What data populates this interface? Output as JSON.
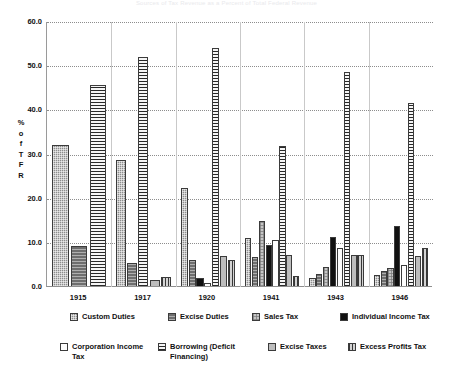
{
  "chart_data": {
    "type": "bar",
    "title": "Sources of Tax Revenue as a Percent of Total Federal Revenue",
    "xlabel": "",
    "ylabel": "% of TFR",
    "ylabel_chars": [
      "%",
      "o",
      "f",
      "T",
      "F",
      "R"
    ],
    "ylim": [
      0.0,
      60.0
    ],
    "yticks": [
      "0.0",
      "10.0",
      "20.0",
      "30.0",
      "40.0",
      "50.0",
      "60.0"
    ],
    "ytick_values": [
      0.0,
      10.0,
      20.0,
      30.0,
      40.0,
      50.0,
      60.0
    ],
    "grid": true,
    "legend_position": "bottom",
    "categories": [
      "1915",
      "1917",
      "1920",
      "1941",
      "1943",
      "1946"
    ],
    "series": [
      {
        "name": "Custom Duties",
        "key": "custom",
        "pattern": "p-custom",
        "color": "#8d8d8d",
        "values": [
          32.0,
          28.5,
          22.2,
          10.8,
          1.9,
          2.4
        ]
      },
      {
        "name": "Excise Duties",
        "key": "excised",
        "pattern": "p-excised",
        "color": "#6e6e6e",
        "values": [
          9.0,
          5.2,
          5.8,
          6.6,
          2.8,
          3.4
        ]
      },
      {
        "name": "Sales Tax",
        "key": "sales",
        "pattern": "p-sales",
        "color": "#c6c6c6",
        "values": [
          0.0,
          0.0,
          0.0,
          14.7,
          4.4,
          4.1
        ]
      },
      {
        "name": "Individual Income Tax",
        "key": "indinc",
        "pattern": "p-indinc",
        "color": "#111111",
        "values": [
          0.0,
          0.0,
          1.8,
          9.3,
          11.1,
          13.5
        ]
      },
      {
        "name": "Corporation Income Tax",
        "key": "corpinc",
        "pattern": "p-corpinc",
        "color": "#fdfdfd",
        "values": [
          0.0,
          0.0,
          0.6,
          10.4,
          8.6,
          4.8
        ]
      },
      {
        "name": "Borrowing (Deficit Financing)",
        "key": "borrow",
        "pattern": "p-borrow",
        "color": "#9b9b9b",
        "values": [
          45.6,
          51.9,
          54.0,
          31.7,
          48.4,
          41.5
        ]
      },
      {
        "name": "Excise Taxes",
        "key": "exctax",
        "pattern": "p-exctax",
        "color": "#bdbdbd",
        "values": [
          0.0,
          1.4,
          6.9,
          7.0,
          7.0,
          6.8
        ]
      },
      {
        "name": "Excess Profits Tax",
        "key": "excprof",
        "pattern": "p-excprof",
        "color": "#9e9e9e",
        "values": [
          0.0,
          2.1,
          6.0,
          2.2,
          7.1,
          8.5
        ]
      }
    ]
  },
  "legend": {
    "row1": [
      "Custom Duties",
      "Excise Duties",
      "Sales Tax",
      "Individual Income Tax"
    ],
    "row2": [
      "Corporation Income Tax",
      "Borrowing (Deficit Financing)",
      "Excise Taxes",
      "Excess Profits Tax"
    ]
  }
}
